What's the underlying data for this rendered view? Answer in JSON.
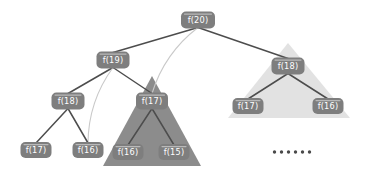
{
  "diagram": {
    "background_color": "#ffffff",
    "node_fill": "#7e7e7e",
    "node_text_color": "#ffffff",
    "node_highlight_color": "#b9b9b9",
    "edge_dark_color": "#4d4d4d",
    "edge_light_color": "#c9c9c9",
    "triangle_dark_color": "#8c8c8c",
    "triangle_light_color": "#e2e2e2",
    "ellipsis_color": "#4a4a4a"
  },
  "nodes": [
    {
      "id": "root",
      "label": "f(20)",
      "x": 198,
      "y": 20,
      "w": 34,
      "h": 17
    },
    {
      "id": "n19",
      "label": "f(19)",
      "x": 113,
      "y": 60,
      "w": 33,
      "h": 17
    },
    {
      "id": "n18_left",
      "label": "f(18)",
      "x": 68,
      "y": 101,
      "w": 33,
      "h": 17
    },
    {
      "id": "n17_leaf",
      "label": "f(17)",
      "x": 36,
      "y": 150,
      "w": 31,
      "h": 16
    },
    {
      "id": "n16_leaf",
      "label": "f(16)",
      "x": 88,
      "y": 150,
      "w": 31,
      "h": 16
    },
    {
      "id": "n17_dark",
      "label": "f(17)",
      "x": 152,
      "y": 101,
      "w": 32,
      "h": 17
    },
    {
      "id": "n16_dark",
      "label": "f(16)",
      "x": 128,
      "y": 152,
      "w": 31,
      "h": 16
    },
    {
      "id": "n15_dark",
      "label": "f(15)",
      "x": 174,
      "y": 152,
      "w": 31,
      "h": 16
    },
    {
      "id": "n18_right",
      "label": "f(18)",
      "x": 288,
      "y": 66,
      "w": 33,
      "h": 17
    },
    {
      "id": "n17_right",
      "label": "f(17)",
      "x": 248,
      "y": 106,
      "w": 31,
      "h": 16
    },
    {
      "id": "n16_right",
      "label": "f(16)",
      "x": 328,
      "y": 106,
      "w": 31,
      "h": 16
    }
  ],
  "triangles": [
    {
      "id": "dark-subtree",
      "shade": "dark",
      "apex_x": 152,
      "apex_y": 76,
      "left_x": 103,
      "right_x": 201,
      "base_y": 166
    },
    {
      "id": "light-subtree",
      "shade": "light",
      "apex_x": 288,
      "apex_y": 43,
      "left_x": 228,
      "right_x": 350,
      "base_y": 118
    }
  ],
  "edges": [
    {
      "from": "root",
      "to": "n19",
      "style": "dark",
      "curve": false
    },
    {
      "from": "root",
      "to": "n17_dark",
      "style": "light",
      "curve": true
    },
    {
      "from": "root",
      "to": "n18_right",
      "style": "dark",
      "curve": false
    },
    {
      "from": "n19",
      "to": "n18_left",
      "style": "dark",
      "curve": false
    },
    {
      "from": "n19",
      "to": "n17_dark",
      "style": "dark",
      "curve": false
    },
    {
      "from": "n19",
      "to": "n16_leaf",
      "style": "light",
      "curve": true
    },
    {
      "from": "n18_left",
      "to": "n17_leaf",
      "style": "dark",
      "curve": false
    },
    {
      "from": "n18_left",
      "to": "n16_leaf",
      "style": "dark",
      "curve": false
    },
    {
      "from": "n17_dark",
      "to": "n16_dark",
      "style": "dark",
      "curve": false
    },
    {
      "from": "n17_dark",
      "to": "n15_dark",
      "style": "dark",
      "curve": false
    },
    {
      "from": "n18_right",
      "to": "n17_right",
      "style": "dark",
      "curve": false
    },
    {
      "from": "n18_right",
      "to": "n16_right",
      "style": "dark",
      "curve": false
    }
  ],
  "ellipsis": {
    "label": "......",
    "dot_count": 6,
    "x": 292,
    "y": 152,
    "dot_radius": 1.7,
    "dot_gap": 7
  }
}
